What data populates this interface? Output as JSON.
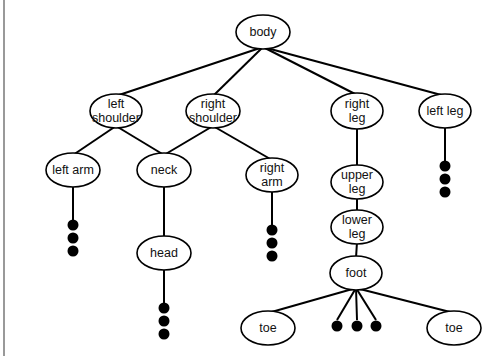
{
  "diagram": {
    "title": "",
    "nodes": [
      {
        "id": "body",
        "label": [
          "body"
        ]
      },
      {
        "id": "left_shoulder",
        "label": [
          "left",
          "shoulder"
        ]
      },
      {
        "id": "right_shoulder",
        "label": [
          "right",
          "shoulder"
        ]
      },
      {
        "id": "right_leg",
        "label": [
          "right",
          "leg"
        ]
      },
      {
        "id": "left_leg",
        "label": [
          "left leg"
        ]
      },
      {
        "id": "left_arm",
        "label": [
          "left arm"
        ]
      },
      {
        "id": "neck",
        "label": [
          "neck"
        ]
      },
      {
        "id": "right_arm",
        "label": [
          "right",
          "arm"
        ]
      },
      {
        "id": "upper_leg",
        "label": [
          "upper",
          "leg"
        ]
      },
      {
        "id": "lower_leg",
        "label": [
          "lower",
          "leg"
        ]
      },
      {
        "id": "foot",
        "label": [
          "foot"
        ]
      },
      {
        "id": "head",
        "label": [
          "head"
        ]
      },
      {
        "id": "toe_left",
        "label": [
          "toe"
        ]
      },
      {
        "id": "toe_right",
        "label": [
          "toe"
        ]
      }
    ],
    "edges": [
      [
        "body",
        "left_shoulder"
      ],
      [
        "body",
        "right_shoulder"
      ],
      [
        "body",
        "right_leg"
      ],
      [
        "body",
        "left_leg"
      ],
      [
        "left_shoulder",
        "left_arm"
      ],
      [
        "left_shoulder",
        "neck"
      ],
      [
        "right_shoulder",
        "neck"
      ],
      [
        "right_shoulder",
        "right_arm"
      ],
      [
        "neck",
        "head"
      ],
      [
        "right_leg",
        "upper_leg"
      ],
      [
        "upper_leg",
        "lower_leg"
      ],
      [
        "lower_leg",
        "foot"
      ],
      [
        "foot",
        "toe_left"
      ],
      [
        "foot",
        "toe_right"
      ]
    ],
    "continuations": [
      {
        "from": "left_arm",
        "style": "vertical-dots"
      },
      {
        "from": "head",
        "style": "vertical-dots"
      },
      {
        "from": "right_arm",
        "style": "vertical-dots"
      },
      {
        "from": "left_leg",
        "style": "vertical-dots"
      },
      {
        "from": "foot",
        "style": "horizontal-dots"
      }
    ]
  }
}
